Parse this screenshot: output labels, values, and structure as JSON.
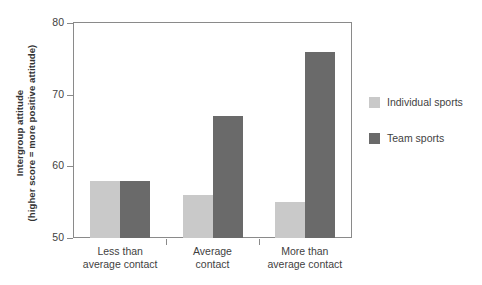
{
  "chart_data": {
    "type": "bar",
    "title": "",
    "xlabel": "",
    "ylabel": "Intergroup attitude (higher score = more positive attitude)",
    "ylabel_lines": [
      "Intergroup attitude",
      "(higher score = more positive attitude)"
    ],
    "categories": [
      "Less than\naverage contact",
      "Average\ncontact",
      "More than\naverage contact"
    ],
    "category_lines": [
      [
        "Less than",
        "average contact"
      ],
      [
        "Average",
        "contact"
      ],
      [
        "More than",
        "average contact"
      ]
    ],
    "series": [
      {
        "name": "Individual sports",
        "color": "#c9c9c9",
        "values": [
          58,
          56,
          55
        ]
      },
      {
        "name": "Team sports",
        "color": "#6a6a6a",
        "values": [
          58,
          67,
          76
        ]
      }
    ],
    "ylim": [
      50,
      80
    ],
    "yticks": [
      50,
      60,
      70,
      80
    ],
    "ytick_labels": [
      "50",
      "60",
      "70",
      "80"
    ],
    "grid": false,
    "legend_position": "right"
  },
  "legend": {
    "items": [
      {
        "label": "Individual sports",
        "color": "#c9c9c9"
      },
      {
        "label": "Team sports",
        "color": "#6a6a6a"
      }
    ]
  },
  "colors": {
    "individual_sports": "#c9c9c9",
    "team_sports": "#6a6a6a",
    "axis": "#8a8a8a",
    "text": "#3f3f3f",
    "background": "#ffffff"
  }
}
